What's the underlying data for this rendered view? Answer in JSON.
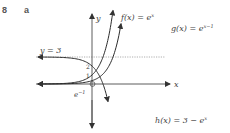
{
  "question": {
    "number": "8",
    "part": "a"
  },
  "colors": {
    "curve": "#2b2b2b",
    "axis": "#4a4a4a",
    "asymptote": "#9a9a9a"
  },
  "axes": {
    "x_label": "x",
    "y_label": "y"
  },
  "asymptote": {
    "label": "y = 3",
    "value": 3
  },
  "ticks": {
    "y_one": "1",
    "y_two": "2",
    "x_e_inv": "e",
    "x_e_inv_exp": "−1"
  },
  "curves": [
    {
      "name": "f",
      "label": "f(x) = e",
      "exp": "x"
    },
    {
      "name": "g",
      "label": "g(x) = e",
      "exp": "x−1"
    },
    {
      "name": "h",
      "label": "h(x) = 3 − e",
      "exp": "x"
    }
  ]
}
